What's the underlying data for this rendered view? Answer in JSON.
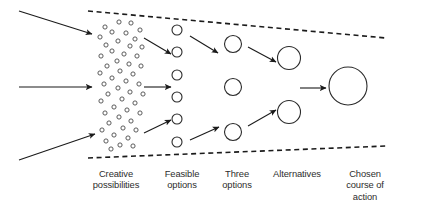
{
  "diagram": {
    "type": "funnel-diagram",
    "colors": {
      "ink": "#1b1b1b",
      "circle_stroke": "#2a2a2a",
      "dot_stroke": "#4a4a4a",
      "label_text": "#2d2d2d",
      "background": "#ffffff"
    },
    "boundaries": [
      {
        "name": "top-dashed-boundary",
        "x1": 88,
        "y1": 11,
        "x2": 386,
        "y2": 38
      },
      {
        "name": "bottom-dashed-boundary",
        "x1": 88,
        "y1": 158,
        "x2": 386,
        "y2": 146
      }
    ],
    "input_arrows": [
      {
        "name": "input-arrow-top",
        "x1": 19,
        "y1": 11,
        "x2": 92,
        "y2": 34
      },
      {
        "name": "input-arrow-middle",
        "x1": 19,
        "y1": 87,
        "x2": 92,
        "y2": 87
      },
      {
        "name": "input-arrow-bottom",
        "x1": 19,
        "y1": 160,
        "x2": 95,
        "y2": 134
      }
    ],
    "stages": [
      {
        "id": "creative-possibilities",
        "label_lines": [
          "Creative",
          "possibilities"
        ],
        "count": 40,
        "shape": "small-hollow-dots",
        "dot_diameter": 4.2
      },
      {
        "id": "feasible-options",
        "label_lines": [
          "Feasible",
          "options"
        ],
        "count": 6,
        "shape": "circle",
        "circle_diameter": 10,
        "x": 177,
        "y_positions": [
          30,
          52,
          75,
          97,
          119,
          142
        ]
      },
      {
        "id": "three-options",
        "label_lines": [
          "Three",
          "options"
        ],
        "count": 3,
        "shape": "circle",
        "circle_diameter": 17,
        "x": 233,
        "y_positions": [
          44,
          87,
          132
        ]
      },
      {
        "id": "alternatives",
        "label_lines": [
          "Alternatives"
        ],
        "count": 2,
        "shape": "circle",
        "circle_diameter": 23,
        "x": 289,
        "y_positions": [
          58,
          112
        ]
      },
      {
        "id": "chosen-course-of-action",
        "label_lines": [
          "Chosen",
          "course of",
          "action"
        ],
        "count": 1,
        "shape": "circle",
        "circle_diameter": 38,
        "x": 348,
        "y_positions": [
          86
        ]
      }
    ],
    "flow_arrows": [
      {
        "name": "flow-dots-to-feasible-upper",
        "x1": 144,
        "y1": 38,
        "x2": 171,
        "y2": 54
      },
      {
        "name": "flow-dots-to-feasible-middle",
        "x1": 144,
        "y1": 87,
        "x2": 171,
        "y2": 87
      },
      {
        "name": "flow-dots-to-feasible-lower",
        "x1": 144,
        "y1": 133,
        "x2": 171,
        "y2": 120
      },
      {
        "name": "flow-feasible-to-three-upper",
        "x1": 190,
        "y1": 36,
        "x2": 218,
        "y2": 53
      },
      {
        "name": "flow-feasible-to-three-lower",
        "x1": 190,
        "y1": 140,
        "x2": 219,
        "y2": 127
      },
      {
        "name": "flow-three-to-alternatives-upper",
        "x1": 248,
        "y1": 47,
        "x2": 276,
        "y2": 62
      },
      {
        "name": "flow-three-to-alternatives-lower",
        "x1": 248,
        "y1": 126,
        "x2": 276,
        "y2": 110
      },
      {
        "name": "flow-alternatives-to-chosen",
        "x1": 300,
        "y1": 88,
        "x2": 326,
        "y2": 88
      }
    ],
    "idea_dots": [
      [
        119,
        22
      ],
      [
        131,
        23
      ],
      [
        105,
        27
      ],
      [
        140,
        30
      ],
      [
        112,
        32
      ],
      [
        126,
        33
      ],
      [
        100,
        37
      ],
      [
        135,
        39
      ],
      [
        118,
        41
      ],
      [
        106,
        45
      ],
      [
        130,
        46
      ],
      [
        142,
        47
      ],
      [
        112,
        51
      ],
      [
        124,
        54
      ],
      [
        101,
        56
      ],
      [
        137,
        56
      ],
      [
        117,
        61
      ],
      [
        129,
        64
      ],
      [
        107,
        66
      ],
      [
        141,
        66
      ],
      [
        120,
        71
      ],
      [
        100,
        73
      ],
      [
        133,
        74
      ],
      [
        112,
        78
      ],
      [
        126,
        81
      ],
      [
        104,
        84
      ],
      [
        139,
        84
      ],
      [
        118,
        88
      ],
      [
        130,
        92
      ],
      [
        108,
        94
      ],
      [
        143,
        94
      ],
      [
        122,
        99
      ],
      [
        101,
        101
      ],
      [
        135,
        103
      ],
      [
        114,
        107
      ],
      [
        127,
        110
      ],
      [
        105,
        113
      ],
      [
        140,
        113
      ],
      [
        119,
        117
      ],
      [
        131,
        121
      ],
      [
        109,
        123
      ],
      [
        123,
        128
      ],
      [
        102,
        130
      ],
      [
        136,
        130
      ],
      [
        114,
        135
      ],
      [
        128,
        138
      ],
      [
        106,
        141
      ],
      [
        120,
        145
      ],
      [
        133,
        146
      ],
      [
        111,
        149
      ]
    ]
  }
}
